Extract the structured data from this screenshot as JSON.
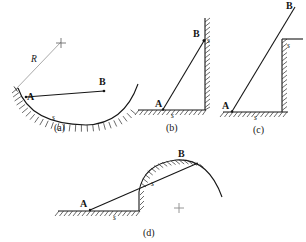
{
  "figure": {
    "type": "physics-textbook-diagram",
    "panel_count": 4,
    "background_color": "#ffffff",
    "ink_color": "#161616",
    "radius_line_color": "#9a9a9a",
    "panels": [
      {
        "id": "a",
        "label": "(a)",
        "description": "Concave circular bowl surface, hatched on the outside; chord from A to B; radius R drawn from center cross to surface at A-side",
        "labels": {
          "point_a": "A",
          "point_b": "B",
          "arc_label": "s",
          "radius_label": "R"
        },
        "center_marker": "+"
      },
      {
        "id": "b",
        "label": "(b)",
        "description": "Horizontal hatched ground and vertical hatched wall on the right; straight incline from A on the ground up to B at the top of the wall",
        "labels": {
          "point_a": "A",
          "point_b": "B",
          "ground_label": "s",
          "wall_label": "s"
        }
      },
      {
        "id": "c",
        "label": "(c)",
        "description": "Horizontal hatched ground, vertical hatched wall with a horizontal ledge at its top; straight line from A on the ground past the ledge corner up to B",
        "labels": {
          "point_a": "A",
          "point_b": "B",
          "ground_label": "s",
          "ledge_label": "s"
        }
      },
      {
        "id": "d",
        "label": "(d)",
        "description": "Horizontal hatched ground ending at a step, then a convex circular hill hatched beneath its surface; straight line from A on the ground tangent over the hill crest to B",
        "labels": {
          "point_a": "A",
          "point_b": "B",
          "ground_label": "s",
          "arc_label": "s"
        },
        "center_marker": "+"
      }
    ]
  }
}
